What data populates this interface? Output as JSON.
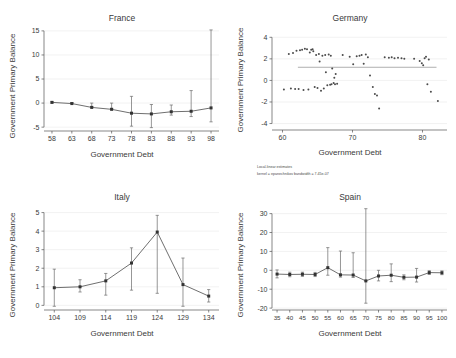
{
  "figure": {
    "panels": [
      "France",
      "Germany",
      "Italy",
      "Spain"
    ],
    "shared_xlabel": "Government Debt",
    "shared_ylabel": "Government Primary Balance"
  },
  "chart_data": [
    {
      "type": "line",
      "title": "France",
      "xlabel": "Government Debt",
      "ylabel": "Government Primary Balance",
      "xlim": [
        56,
        100
      ],
      "ylim": [
        -5.8,
        15.6
      ],
      "xticks": [
        58,
        63,
        68,
        73,
        78,
        83,
        88,
        93,
        98
      ],
      "yticks": [
        -5,
        0,
        5,
        10,
        15
      ],
      "grid": true,
      "legend": "none",
      "x": [
        58,
        63,
        68,
        73,
        78,
        83,
        88,
        93,
        98
      ],
      "values": [
        0.15,
        -0.1,
        -0.9,
        -1.3,
        -2.1,
        -2.25,
        -1.8,
        -1.7,
        -1.0
      ],
      "err_low": [
        0.0,
        0.0,
        0.0,
        0.0,
        -4.8,
        -5.1,
        -2.5,
        -2.8,
        -3.9
      ],
      "err_high": [
        0.3,
        0.1,
        -0.7,
        -1.1,
        1.4,
        -0.3,
        -0.4,
        2.6,
        15.2
      ]
    },
    {
      "type": "scatter",
      "title": "Germany",
      "xlabel": "Government Debt",
      "ylabel": "Government Primary Balance",
      "xlim": [
        58.5,
        83.5
      ],
      "ylim": [
        -4.6,
        4.4
      ],
      "xticks": [
        60,
        70,
        80
      ],
      "yticks": [
        -4,
        -2,
        0,
        2,
        4
      ],
      "grid": true,
      "legend": "none",
      "fit_line": {
        "y": 1.22,
        "x_start": 62.2,
        "x_end": 82.0
      },
      "caption_line1": "Local-linear estimates",
      "caption_line2": "kernel = epanechnikov bandwidth = 7.45e-07",
      "points": [
        [
          60.2,
          -0.85
        ],
        [
          60.9,
          2.45
        ],
        [
          61.2,
          -0.75
        ],
        [
          61.5,
          2.55
        ],
        [
          61.8,
          -0.8
        ],
        [
          62.0,
          2.75
        ],
        [
          62.3,
          -0.8
        ],
        [
          62.5,
          2.8
        ],
        [
          62.8,
          2.85
        ],
        [
          63.0,
          -0.9
        ],
        [
          63.2,
          2.95
        ],
        [
          63.5,
          2.9
        ],
        [
          63.7,
          -0.85
        ],
        [
          63.9,
          2.6
        ],
        [
          64.1,
          2.85
        ],
        [
          64.3,
          2.9
        ],
        [
          64.4,
          2.7
        ],
        [
          64.6,
          -0.6
        ],
        [
          64.8,
          2.35
        ],
        [
          65.0,
          -0.7
        ],
        [
          65.2,
          2.45
        ],
        [
          65.3,
          1.75
        ],
        [
          65.5,
          -0.95
        ],
        [
          65.7,
          2.3
        ],
        [
          65.9,
          -0.75
        ],
        [
          66.1,
          2.35
        ],
        [
          66.2,
          0.75
        ],
        [
          66.4,
          -0.45
        ],
        [
          66.6,
          2.4
        ],
        [
          66.8,
          -0.4
        ],
        [
          66.9,
          2.3
        ],
        [
          67.0,
          -0.35
        ],
        [
          67.1,
          1.1
        ],
        [
          67.3,
          -0.25
        ],
        [
          67.4,
          0.25
        ],
        [
          67.5,
          -0.35
        ],
        [
          67.6,
          0.6
        ],
        [
          67.8,
          -0.3
        ],
        [
          68.6,
          2.35
        ],
        [
          69.6,
          2.2
        ],
        [
          70.1,
          1.5
        ],
        [
          70.6,
          2.25
        ],
        [
          71.0,
          2.3
        ],
        [
          71.3,
          2.35
        ],
        [
          71.6,
          1.55
        ],
        [
          71.9,
          2.4
        ],
        [
          72.2,
          2.15
        ],
        [
          72.5,
          0.45
        ],
        [
          72.9,
          -0.6
        ],
        [
          73.2,
          -1.25
        ],
        [
          73.5,
          -1.4
        ],
        [
          73.8,
          -2.6
        ],
        [
          74.6,
          2.15
        ],
        [
          75.2,
          2.1
        ],
        [
          75.6,
          2.15
        ],
        [
          76.0,
          2.05
        ],
        [
          76.5,
          2.1
        ],
        [
          77.0,
          2.05
        ],
        [
          77.4,
          2.0
        ],
        [
          78.8,
          2.0
        ],
        [
          79.6,
          1.8
        ],
        [
          79.9,
          1.6
        ],
        [
          80.1,
          1.4
        ],
        [
          80.3,
          2.05
        ],
        [
          80.5,
          2.2
        ],
        [
          80.7,
          -0.35
        ],
        [
          80.9,
          1.95
        ],
        [
          81.2,
          -1.05
        ],
        [
          82.2,
          -1.9
        ]
      ]
    },
    {
      "type": "line",
      "title": "Italy",
      "xlabel": "Government Debt",
      "ylabel": "Government Primary Balance",
      "xlim": [
        102,
        136
      ],
      "ylim": [
        -0.25,
        5.3
      ],
      "xticks": [
        104,
        109,
        114,
        119,
        124,
        129,
        134
      ],
      "yticks": [
        0,
        1,
        2,
        3,
        4,
        5
      ],
      "grid": true,
      "legend": "none",
      "x": [
        104,
        109,
        114,
        119,
        124,
        129,
        134
      ],
      "values": [
        0.95,
        1.0,
        1.32,
        2.28,
        3.95,
        1.12,
        0.5
      ],
      "err_low": [
        -0.05,
        0.72,
        0.55,
        0.82,
        0.65,
        -0.05,
        0.18
      ],
      "err_high": [
        1.95,
        1.38,
        1.72,
        3.1,
        4.85,
        2.55,
        0.85
      ]
    },
    {
      "type": "line",
      "title": "Spain",
      "xlabel": "Government Debt",
      "ylabel": "Government Primary Balance",
      "xlim": [
        33,
        102
      ],
      "ylim": [
        -21,
        33.5
      ],
      "xticks": [
        35,
        40,
        45,
        50,
        55,
        60,
        65,
        70,
        75,
        80,
        85,
        90,
        95,
        100
      ],
      "yticks": [
        -20,
        -10,
        0,
        10,
        20,
        30
      ],
      "grid": true,
      "legend": "none",
      "x": [
        35,
        40,
        45,
        50,
        55,
        60,
        65,
        70,
        75,
        80,
        85,
        90,
        95,
        100
      ],
      "values": [
        -2.0,
        -2.2,
        -2.1,
        -2.2,
        1.4,
        -2.4,
        -2.5,
        -5.6,
        -3.0,
        -2.6,
        -3.7,
        -3.6,
        -1.2,
        -1.3
      ],
      "err_low": [
        -4.0,
        -3.4,
        -3.2,
        -3.3,
        -2.6,
        -3.6,
        -3.8,
        -17.4,
        -5.6,
        -6.0,
        -5.0,
        -6.2,
        -2.2,
        -2.3
      ],
      "err_high": [
        0.2,
        -1.0,
        -1.0,
        -1.1,
        12.0,
        10.2,
        9.3,
        32.6,
        0.0,
        3.4,
        -2.4,
        1.0,
        -0.2,
        -0.3
      ]
    }
  ]
}
